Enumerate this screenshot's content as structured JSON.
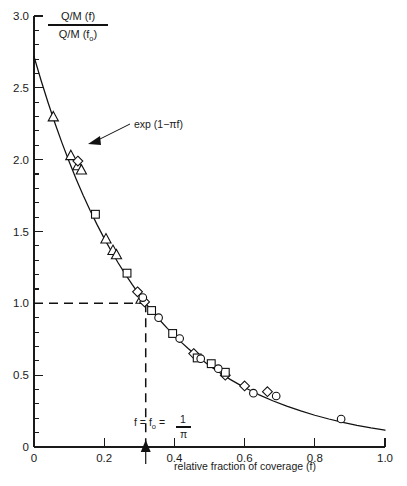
{
  "chart_data": {
    "type": "line",
    "title": "",
    "xlabel": "relative fraction of coverage (f)",
    "ylabel_numerator": "Q/M (f)",
    "ylabel_denominator": "Q/M (f",
    "ylabel_denominator_sub": "o",
    "ylabel_denominator_tail": ")",
    "xlim": [
      0,
      1.0
    ],
    "ylim": [
      0,
      3.0
    ],
    "grid": false,
    "legend": "none",
    "x_ticks": [
      0,
      0.2,
      0.4,
      0.6,
      0.8,
      1.0
    ],
    "x_tick_labels": [
      "0",
      "0.2",
      "0.4",
      "0.6",
      "0.8",
      "1.0"
    ],
    "y_ticks": [
      0,
      0.5,
      1.0,
      1.5,
      2.0,
      2.5,
      3.0
    ],
    "y_tick_labels": [
      "0",
      "0.5",
      "1.0",
      "1.5",
      "2.0",
      "2.5",
      "3.0"
    ],
    "y_minor_step": 0.1,
    "curve_label": "exp (1−πf)",
    "curve_formula": "exp(1 - pi*f)",
    "curve_points": [
      [
        0.0,
        2.718
      ],
      [
        0.02,
        2.553
      ],
      [
        0.04,
        2.398
      ],
      [
        0.06,
        2.252
      ],
      [
        0.08,
        2.115
      ],
      [
        0.1,
        1.987
      ],
      [
        0.12,
        1.866
      ],
      [
        0.14,
        1.752
      ],
      [
        0.16,
        1.646
      ],
      [
        0.18,
        1.546
      ],
      [
        0.2,
        1.452
      ],
      [
        0.22,
        1.364
      ],
      [
        0.24,
        1.281
      ],
      [
        0.26,
        1.203
      ],
      [
        0.28,
        1.13
      ],
      [
        0.3,
        1.061
      ],
      [
        0.3183,
        1.0
      ],
      [
        0.34,
        0.936
      ],
      [
        0.36,
        0.879
      ],
      [
        0.38,
        0.826
      ],
      [
        0.4,
        0.776
      ],
      [
        0.42,
        0.728
      ],
      [
        0.44,
        0.684
      ],
      [
        0.46,
        0.642
      ],
      [
        0.48,
        0.603
      ],
      [
        0.5,
        0.566
      ],
      [
        0.52,
        0.532
      ],
      [
        0.54,
        0.5
      ],
      [
        0.56,
        0.469
      ],
      [
        0.58,
        0.441
      ],
      [
        0.6,
        0.414
      ],
      [
        0.64,
        0.365
      ],
      [
        0.68,
        0.322
      ],
      [
        0.72,
        0.284
      ],
      [
        0.76,
        0.251
      ],
      [
        0.8,
        0.221
      ],
      [
        0.84,
        0.195
      ],
      [
        0.88,
        0.172
      ],
      [
        0.92,
        0.151
      ],
      [
        0.96,
        0.133
      ],
      [
        1.0,
        0.118
      ]
    ],
    "reference_point": {
      "x": 0.3183,
      "y": 1.0
    },
    "reference_annotation": "f = f",
    "reference_annotation_sub": "o",
    "reference_annotation_eq": " = ",
    "reference_fraction_top": "1",
    "reference_fraction_bottom": "π",
    "series": [
      {
        "name": "triangles",
        "marker": "triangle",
        "points": [
          [
            0.055,
            2.3
          ],
          [
            0.105,
            2.03
          ],
          [
            0.125,
            1.96
          ],
          [
            0.135,
            1.93
          ],
          [
            0.205,
            1.45
          ],
          [
            0.225,
            1.37
          ],
          [
            0.235,
            1.34
          ],
          [
            0.305,
            1.03
          ]
        ]
      },
      {
        "name": "diamonds",
        "marker": "diamond",
        "points": [
          [
            0.125,
            1.99
          ],
          [
            0.295,
            1.08
          ],
          [
            0.315,
            1.01
          ],
          [
            0.455,
            0.65
          ],
          [
            0.545,
            0.5
          ],
          [
            0.6,
            0.425
          ],
          [
            0.665,
            0.385
          ]
        ]
      },
      {
        "name": "squares",
        "marker": "square",
        "points": [
          [
            0.175,
            1.62
          ],
          [
            0.265,
            1.21
          ],
          [
            0.335,
            0.95
          ],
          [
            0.395,
            0.79
          ],
          [
            0.465,
            0.62
          ],
          [
            0.505,
            0.58
          ],
          [
            0.545,
            0.52
          ]
        ]
      },
      {
        "name": "circles",
        "marker": "circle",
        "points": [
          [
            0.31,
            1.04
          ],
          [
            0.355,
            0.9
          ],
          [
            0.415,
            0.755
          ],
          [
            0.475,
            0.615
          ],
          [
            0.525,
            0.545
          ],
          [
            0.625,
            0.375
          ],
          [
            0.69,
            0.355
          ],
          [
            0.875,
            0.195
          ]
        ]
      }
    ]
  }
}
